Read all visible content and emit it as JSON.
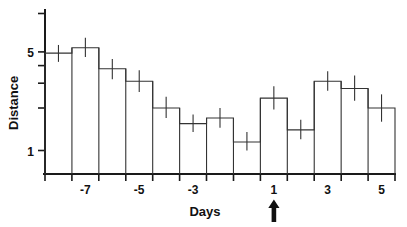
{
  "chart_data": {
    "type": "bar",
    "title": "",
    "xlabel": "Days",
    "ylabel": "Distance",
    "yscale": "log",
    "ylim": [
      0.72,
      6.6
    ],
    "grid": false,
    "legend": null,
    "x": [
      -8,
      -7,
      -6,
      -5,
      -4,
      -3,
      -2,
      -1,
      1,
      2,
      3,
      4,
      5
    ],
    "categories": [
      "-8",
      "-7",
      "-6",
      "-5",
      "-4",
      "-3",
      "-2",
      "-1",
      "1",
      "2",
      "3",
      "4",
      "5"
    ],
    "values": [
      4.9,
      5.35,
      3.8,
      3.1,
      2.0,
      1.55,
      1.7,
      1.15,
      2.35,
      1.4,
      3.1,
      2.75,
      2.0
    ],
    "errors_low": [
      4.25,
      4.6,
      3.2,
      2.6,
      1.7,
      1.35,
      1.45,
      1.0,
      1.95,
      1.2,
      2.65,
      2.25,
      1.6
    ],
    "errors_high": [
      5.6,
      6.3,
      4.45,
      3.7,
      2.4,
      1.8,
      2.0,
      1.35,
      2.85,
      1.65,
      3.65,
      3.4,
      2.5
    ],
    "xticks": [
      -7,
      -5,
      -3,
      1,
      3,
      5
    ],
    "xticklabels": [
      "-7",
      "-5",
      "-3",
      "1",
      "3",
      "5"
    ],
    "yticks": [
      1,
      2,
      3,
      4,
      5
    ],
    "yticklabels": [
      "1",
      "",
      "",
      "",
      "5"
    ],
    "annotation": {
      "name": "up-arrow-marker",
      "glyph": "arrow-up",
      "at_x": 1,
      "label": ""
    }
  },
  "axes": {
    "y_title": "Distance",
    "x_title": "Days",
    "y_label_1": "1",
    "y_label_5": "5",
    "x_label_m7": "-7",
    "x_label_m5": "-5",
    "x_label_m3": "-3",
    "x_label_1": "1",
    "x_label_3": "3",
    "x_label_5": "5"
  }
}
